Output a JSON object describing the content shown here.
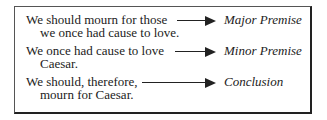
{
  "rows": [
    {
      "lines": [
        "We should mourn for those",
        "we once had cause to love."
      ],
      "label": "Major Premise"
    },
    {
      "lines": [
        "We once had cause to love",
        "Caesar."
      ],
      "label": "Minor Premise"
    },
    {
      "lines": [
        "We should, therefore,",
        "mourn for Caesar."
      ],
      "label": "Conclusion"
    }
  ],
  "colors": {
    "text": "#222222",
    "border": "#222222",
    "background": "#ffffff"
  }
}
